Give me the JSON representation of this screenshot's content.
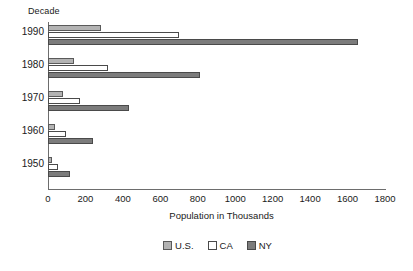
{
  "chart_data": {
    "type": "bar",
    "orientation": "horizontal",
    "title": "",
    "xlabel": "Population in Thousands",
    "ylabel": "Decade",
    "categories": [
      "1990",
      "1980",
      "1970",
      "1960",
      "1950"
    ],
    "series": [
      {
        "name": "U.S.",
        "color": "#b3b3b3",
        "values": [
          285,
          140,
          80,
          38,
          22
        ]
      },
      {
        "name": "CA",
        "color": "#ffffff",
        "values": [
          700,
          320,
          170,
          95,
          55
        ]
      },
      {
        "name": "NY",
        "color": "#7c7c7c",
        "values": [
          1655,
          810,
          435,
          240,
          120
        ]
      }
    ],
    "xlim": [
      0,
      1800
    ],
    "xticks": [
      0,
      200,
      400,
      600,
      800,
      1000,
      1200,
      1400,
      1600,
      1800
    ],
    "xtick_labels": [
      "0",
      "200",
      "400",
      "600",
      "800",
      "1000",
      "1200",
      "1400",
      "1600",
      "1800"
    ],
    "grid": false,
    "legend_position": "bottom",
    "legend_entries": [
      "U.S.",
      "CA",
      "NY"
    ]
  }
}
